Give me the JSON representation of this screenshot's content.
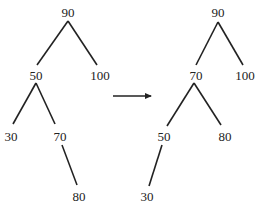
{
  "diagram": {
    "type": "binary-search-tree-rotation",
    "before": {
      "nodes": [
        {
          "id": "b90",
          "label": "90",
          "x": 68,
          "y": 12
        },
        {
          "id": "b50",
          "label": "50",
          "x": 36,
          "y": 75
        },
        {
          "id": "b100",
          "label": "100",
          "x": 100,
          "y": 75
        },
        {
          "id": "b30",
          "label": "30",
          "x": 11,
          "y": 136
        },
        {
          "id": "b70",
          "label": "70",
          "x": 60,
          "y": 136
        },
        {
          "id": "b80",
          "label": "80",
          "x": 79,
          "y": 196
        }
      ],
      "edges": [
        {
          "from": "b90",
          "to": "b50",
          "x1": 68,
          "y1": 21,
          "x2": 37,
          "y2": 65
        },
        {
          "from": "b90",
          "to": "b100",
          "x1": 68,
          "y1": 21,
          "x2": 97,
          "y2": 65
        },
        {
          "from": "b50",
          "to": "b30",
          "x1": 36,
          "y1": 83,
          "x2": 13,
          "y2": 124
        },
        {
          "from": "b50",
          "to": "b70",
          "x1": 36,
          "y1": 83,
          "x2": 55,
          "y2": 124
        },
        {
          "from": "b70",
          "to": "b80",
          "x1": 62,
          "y1": 145,
          "x2": 77,
          "y2": 185
        }
      ]
    },
    "arrow": {
      "x1": 113,
      "y1": 96,
      "x2": 156,
      "y2": 96,
      "color": "#222222"
    },
    "after": {
      "nodes": [
        {
          "id": "a90",
          "label": "90",
          "x": 218,
          "y": 12
        },
        {
          "id": "a70",
          "label": "70",
          "x": 196,
          "y": 75
        },
        {
          "id": "a100",
          "label": "100",
          "x": 245,
          "y": 75
        },
        {
          "id": "a50",
          "label": "50",
          "x": 164,
          "y": 136
        },
        {
          "id": "a80",
          "label": "80",
          "x": 225,
          "y": 136
        },
        {
          "id": "a30",
          "label": "30",
          "x": 147,
          "y": 196
        }
      ],
      "edges": [
        {
          "from": "a90",
          "to": "a70",
          "x1": 218,
          "y1": 22,
          "x2": 196,
          "y2": 65
        },
        {
          "from": "a90",
          "to": "a100",
          "x1": 218,
          "y1": 22,
          "x2": 243,
          "y2": 65
        },
        {
          "from": "a70",
          "to": "a50",
          "x1": 194,
          "y1": 83,
          "x2": 167,
          "y2": 126
        },
        {
          "from": "a70",
          "to": "a80",
          "x1": 194,
          "y1": 83,
          "x2": 221,
          "y2": 125
        },
        {
          "from": "a50",
          "to": "a30",
          "x1": 162,
          "y1": 145,
          "x2": 149,
          "y2": 186
        }
      ]
    },
    "line_color": "#222222"
  }
}
